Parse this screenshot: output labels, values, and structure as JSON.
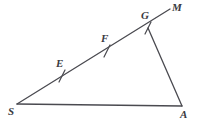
{
  "figure": {
    "kind": "geometry-diagram",
    "width": 198,
    "height": 128,
    "background_color": "#ffffff",
    "stroke_color": "#4a4a50",
    "label_color": "#3a3a3f",
    "stroke_width": 1.3
  },
  "points": [
    {
      "id": "S",
      "label": "S",
      "x": 17,
      "y": 104,
      "label_x": 8,
      "label_y": 106,
      "vertex": true
    },
    {
      "id": "A",
      "label": "A",
      "x": 182,
      "y": 106,
      "label_x": 180,
      "label_y": 109,
      "vertex": true
    },
    {
      "id": "G",
      "label": "G",
      "x": 148,
      "y": 28,
      "label_x": 141,
      "label_y": 10,
      "vertex": true
    },
    {
      "id": "M",
      "label": "M",
      "x": 170,
      "y": 9,
      "label_x": 172,
      "label_y": 2,
      "vertex": false
    },
    {
      "id": "E",
      "label": "E",
      "x": 62,
      "y": 76,
      "label_x": 56,
      "label_y": 58,
      "vertex": false
    },
    {
      "id": "F",
      "label": "F",
      "x": 107,
      "y": 51,
      "label_x": 101,
      "label_y": 33,
      "vertex": false
    }
  ],
  "segments": [
    {
      "id": "SM",
      "from": "S",
      "to": "M",
      "x1": 17,
      "y1": 104,
      "x2": 170,
      "y2": 9,
      "name": "ray-s-to-m"
    },
    {
      "id": "SA",
      "from": "S",
      "to": "A",
      "x1": 17,
      "y1": 104,
      "x2": 182,
      "y2": 106,
      "name": "segment-s-to-a"
    },
    {
      "id": "GA",
      "from": "G",
      "to": "A",
      "x1": 148,
      "y1": 28,
      "x2": 182,
      "y2": 106,
      "name": "segment-g-to-a"
    }
  ],
  "tick_marks": [
    {
      "id": "tick-E",
      "at": "E",
      "x": 62,
      "y": 76,
      "x1": 59,
      "y1": 82,
      "x2": 65,
      "y2": 70
    },
    {
      "id": "tick-F",
      "at": "F",
      "x": 107,
      "y": 51,
      "x1": 104,
      "y1": 57,
      "x2": 110,
      "y2": 45
    },
    {
      "id": "tick-G",
      "at": "G",
      "x": 148,
      "y": 28,
      "x1": 145,
      "y1": 34,
      "x2": 151,
      "y2": 22
    }
  ]
}
